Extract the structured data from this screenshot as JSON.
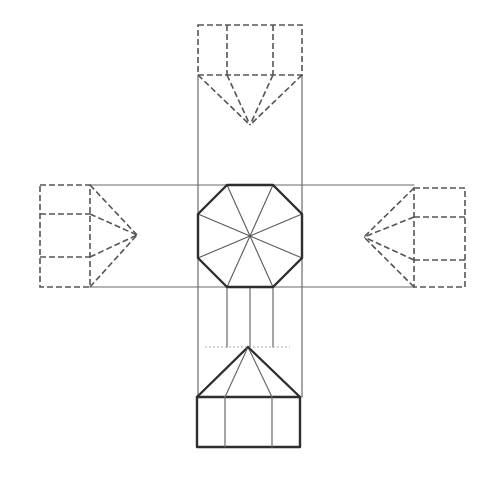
{
  "drawing": {
    "subject": "octagonal pyramid developed orthographic projection",
    "canvas": {
      "width": 497,
      "height": 482,
      "background": "#ffffff"
    },
    "colors": {
      "outline_bold": "#2e2e2e",
      "projection_line": "#6a6a6a",
      "hidden_line": "#555555",
      "guide_line": "#9a9a9a"
    },
    "plan_view": {
      "shape": "octagon",
      "vertices": [
        [
          227,
          185
        ],
        [
          273,
          185
        ],
        [
          302,
          214
        ],
        [
          302,
          258
        ],
        [
          273,
          287
        ],
        [
          227,
          287
        ],
        [
          198,
          258
        ],
        [
          198,
          214
        ]
      ],
      "center": [
        250,
        236
      ],
      "radial_lines": 8
    },
    "projection_lines": {
      "horizontal": [
        {
          "x1": 90,
          "y1": 185,
          "x2": 414,
          "y2": 185
        },
        {
          "x1": 90,
          "y1": 287,
          "x2": 414,
          "y2": 287
        }
      ],
      "vertical": [
        {
          "x1": 198,
          "y1": 75,
          "x2": 198,
          "y2": 397
        },
        {
          "x1": 302,
          "y1": 75,
          "x2": 302,
          "y2": 397
        },
        {
          "x1": 227,
          "y1": 287,
          "x2": 227,
          "y2": 347
        },
        {
          "x1": 273,
          "y1": 287,
          "x2": 273,
          "y2": 347
        },
        {
          "x1": 250,
          "y1": 287,
          "x2": 250,
          "y2": 347
        }
      ]
    },
    "views": {
      "top": {
        "style": "hidden",
        "rect": {
          "x": 198,
          "y": 25,
          "w": 104,
          "h": 50
        },
        "dividers_x": [
          227,
          273
        ],
        "apex": [
          250,
          125
        ],
        "base_points": [
          [
            198,
            75
          ],
          [
            227,
            75
          ],
          [
            273,
            75
          ],
          [
            302,
            75
          ]
        ]
      },
      "bottom": {
        "style": "solid",
        "rect": {
          "x": 197,
          "y": 397,
          "w": 103,
          "h": 50
        },
        "dividers_x": [
          225,
          272
        ],
        "apex": [
          248,
          347
        ],
        "base_points": [
          [
            197,
            397
          ],
          [
            225,
            397
          ],
          [
            272,
            397
          ],
          [
            300,
            397
          ]
        ],
        "guide": {
          "x1": 205,
          "y1": 347,
          "x2": 290,
          "y2": 347
        }
      },
      "left": {
        "style": "hidden",
        "rect": {
          "x": 40,
          "y": 185,
          "w": 50,
          "h": 102
        },
        "dividers_y": [
          214,
          257
        ],
        "apex": [
          137,
          235
        ],
        "base_points": [
          [
            90,
            185
          ],
          [
            90,
            214
          ],
          [
            90,
            257
          ],
          [
            90,
            287
          ]
        ]
      },
      "right": {
        "style": "hidden",
        "rect": {
          "x": 414,
          "y": 188,
          "w": 51,
          "h": 99
        },
        "dividers_y": [
          217,
          260
        ],
        "apex": [
          364,
          237
        ],
        "base_points": [
          [
            414,
            188
          ],
          [
            414,
            217
          ],
          [
            414,
            260
          ],
          [
            414,
            287
          ]
        ]
      }
    }
  }
}
